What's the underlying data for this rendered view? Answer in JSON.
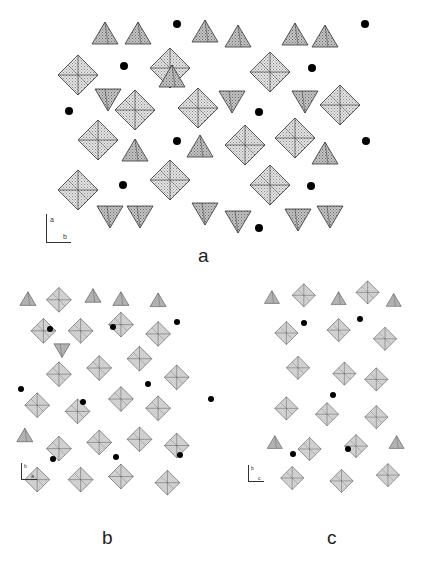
{
  "figure": {
    "panels": [
      {
        "id": "a",
        "label": "a",
        "axes": {
          "vertical": "a",
          "horizontal": "b"
        }
      },
      {
        "id": "b",
        "label": "b",
        "axes": {
          "vertical": "b",
          "horizontal": "a"
        }
      },
      {
        "id": "c",
        "label": "c",
        "axes": {
          "vertical": "b",
          "horizontal": "c"
        }
      }
    ],
    "colors": {
      "octahedra_fill": "#cfcfcf",
      "tetrahedra_fill": "#b8b8b8",
      "edge": "#333333",
      "cation_dot": "#000000",
      "background": "#ffffff"
    }
  }
}
